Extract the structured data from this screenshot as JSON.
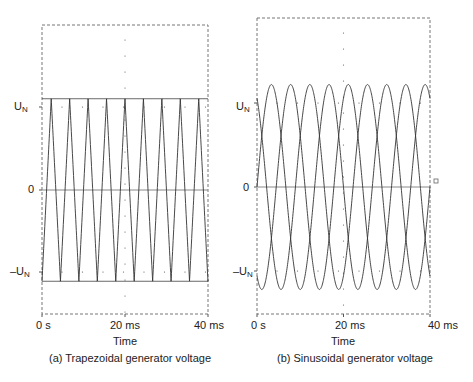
{
  "chart_data": [
    {
      "type": "line",
      "title": "(a) Trapezoidal generator voltage",
      "xlabel": "Time",
      "ylabel": "",
      "x_ticks": [
        "0 s",
        "20 ms",
        "40 ms"
      ],
      "y_ticks": [
        "U_N",
        "0",
        "-U_N"
      ],
      "xlim": [
        0,
        40
      ],
      "series": [
        {
          "name": "Phase 1",
          "shape": "trapezoid",
          "period_ms": 13.33,
          "amplitude": 1.0,
          "phase_deg": 0
        },
        {
          "name": "Phase 2",
          "shape": "trapezoid",
          "period_ms": 13.33,
          "amplitude": 1.0,
          "phase_deg": 120
        },
        {
          "name": "Phase 3",
          "shape": "trapezoid",
          "period_ms": 13.33,
          "amplitude": 1.0,
          "phase_deg": 240
        }
      ],
      "grid": "dotted center line"
    },
    {
      "type": "line",
      "title": "(b) Sinusoidal generator voltage",
      "xlabel": "Time",
      "ylabel": "",
      "x_ticks": [
        "0 s",
        "20 ms",
        "40 ms"
      ],
      "y_ticks": [
        "U_N",
        "0",
        "-U_N"
      ],
      "xlim": [
        0,
        40
      ],
      "series": [
        {
          "name": "Phase 1",
          "shape": "sine",
          "period_ms": 13.33,
          "amplitude": 1.22,
          "phase_deg": 0
        },
        {
          "name": "Phase 2",
          "shape": "sine",
          "period_ms": 13.33,
          "amplitude": 1.22,
          "phase_deg": 120
        },
        {
          "name": "Phase 3",
          "shape": "sine",
          "period_ms": 13.33,
          "amplitude": 1.22,
          "phase_deg": 240
        }
      ],
      "grid": "dotted center line"
    }
  ],
  "left": {
    "y_top": "U",
    "y_top_sub": "N",
    "y_zero": "0",
    "y_bottom": "–U",
    "y_bottom_sub": "N",
    "x0": "0 s",
    "x1": "20 ms",
    "x2": "40 ms",
    "xlabel": "Time",
    "caption": "(a) Trapezoidal generator voltage"
  },
  "right": {
    "y_top": "U",
    "y_top_sub": "N",
    "y_zero": "0",
    "y_bottom": "–U",
    "y_bottom_sub": "N",
    "x0": "0 s",
    "x1": "20 ms",
    "x2": "40 ms",
    "xlabel": "Time",
    "caption": "(b) Sinusoidal generator voltage"
  }
}
